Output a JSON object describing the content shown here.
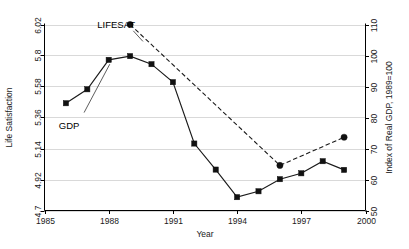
{
  "chart_data": {
    "type": "line",
    "title": "",
    "xlabel": "Year",
    "ylabel": "Life Satisfaction",
    "y2label": "Index of Real GDP, 1989=100",
    "xlim": [
      1985,
      2000
    ],
    "ylim": [
      4.7,
      6.02
    ],
    "y2lim": [
      50,
      110
    ],
    "grid": true,
    "legend_position": "inline-annotations",
    "xticks": [
      "1985",
      "1988",
      "1991",
      "1994",
      "1997",
      "2000"
    ],
    "xtick_values": [
      1985,
      1988,
      1991,
      1994,
      1997,
      2000
    ],
    "yticks": [
      "4.7",
      "4.92",
      "5.14",
      "5.36",
      "5.58",
      "5.8",
      "6.02"
    ],
    "ytick_values": [
      4.7,
      4.92,
      5.14,
      5.36,
      5.58,
      5.8,
      6.02
    ],
    "y2ticks": [
      "50",
      "60",
      "70",
      "80",
      "90",
      "100",
      "110"
    ],
    "y2tick_values": [
      50,
      60,
      70,
      80,
      90,
      100,
      110
    ],
    "annotations": [
      {
        "text": "LIFESAT",
        "x": 1988.35,
        "y": 6.02
      },
      {
        "text": "GDP",
        "x": 1986.15,
        "y": 5.33
      }
    ],
    "series": [
      {
        "name": "GDP",
        "axis": "right",
        "marker": "square",
        "linestyle": "solid",
        "color": "#111111",
        "x": [
          1986,
          1987,
          1988,
          1989,
          1990,
          1991,
          1992,
          1993,
          1994,
          1995,
          1996,
          1997,
          1998,
          1999
        ],
        "values": [
          84.6,
          89.1,
          98.6,
          99.8,
          97.2,
          91.4,
          71.6,
          63.2,
          54.3,
          56.2,
          60.1,
          62.0,
          65.9,
          63.1
        ]
      },
      {
        "name": "LIFESAT",
        "axis": "left",
        "marker": "circle",
        "linestyle": "dashed",
        "color": "#111111",
        "x": [
          1989,
          1996,
          1999
        ],
        "values": [
          6.02,
          5.02,
          5.22
        ]
      }
    ]
  },
  "labels": {
    "xlabel": "Year",
    "ylabel": "Life Satisfaction",
    "y2label": "Index of Real GDP, 1989=100",
    "series_gdp": "GDP",
    "series_lifesat": "LIFESAT"
  }
}
